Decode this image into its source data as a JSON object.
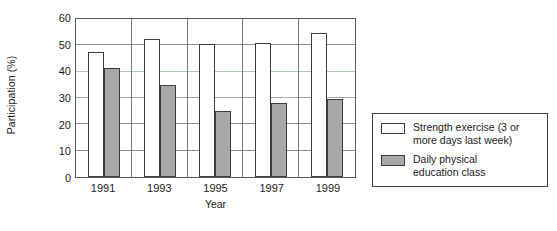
{
  "chart_data": {
    "type": "bar",
    "title": "",
    "subtitle": "",
    "xlabel": "Year",
    "ylabel": "Participation (%)",
    "categories": [
      "1991",
      "1993",
      "1995",
      "1997",
      "1999"
    ],
    "series": [
      {
        "name": "Strength exercise (3 or more days last week)",
        "color": "#ffffff",
        "values": [
          47.5,
          52.5,
          50.5,
          51.0,
          54.5
        ]
      },
      {
        "name": "Daily physical education class",
        "color": "#a8a8a8",
        "values": [
          41.5,
          35.0,
          25.0,
          28.0,
          29.5
        ]
      }
    ],
    "ylim": [
      0,
      60
    ],
    "yticks": [
      0,
      10,
      20,
      30,
      40,
      50,
      60
    ],
    "ytick_labels": [
      "0",
      "10",
      "20",
      "30",
      "40",
      "50",
      "60"
    ],
    "grid": true,
    "gridline_colors": {
      "10": "#8f8f8f",
      "20": "#8f8f8f",
      "30": "#9aa8ac",
      "40": "#b4ccb4",
      "50": "#8f8f8f"
    },
    "legend_position": "right",
    "legend_entries": [
      {
        "label_line1": "Strength exercise (3 or",
        "label_line2": "more days last week)",
        "swatch": "light"
      },
      {
        "label_line1": "Daily physical",
        "label_line2": "education class",
        "swatch": "dark"
      }
    ],
    "axis_color": "#5a5a5a",
    "bar_border_color": "#3c3c3c"
  }
}
